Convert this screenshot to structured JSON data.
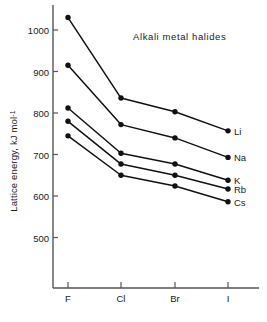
{
  "chart_data": {
    "type": "line",
    "title": "Alkali metal halides",
    "xlabel": "",
    "ylabel": "Lattice energy,  kJ mol",
    "ylabel_exponent": "-1",
    "categories": [
      "F",
      "Cl",
      "Br",
      "I"
    ],
    "series": [
      {
        "name": "Li",
        "values": [
          1030,
          836,
          803,
          757
        ]
      },
      {
        "name": "Na",
        "values": [
          915,
          772,
          740,
          693
        ]
      },
      {
        "name": "K",
        "values": [
          812,
          703,
          677,
          638
        ]
      },
      {
        "name": "Rb",
        "values": [
          780,
          677,
          650,
          617
        ]
      },
      {
        "name": "Cs",
        "values": [
          745,
          650,
          624,
          586
        ]
      }
    ],
    "yticks": [
      500,
      600,
      700,
      800,
      900,
      1000
    ],
    "ylim": [
      455,
      1055
    ],
    "grid": false,
    "legend_position": "right-inline",
    "marker": "filled-circle",
    "line_color": "#111111",
    "marker_color": "#111111",
    "axis_color": "#555555",
    "background": "#ffffff"
  }
}
